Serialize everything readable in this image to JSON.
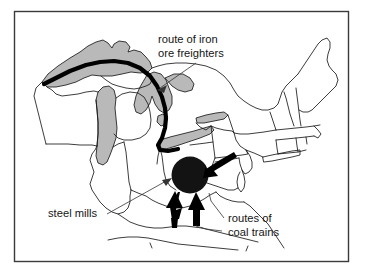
{
  "figure": {
    "type": "thematic-map",
    "region": "Northeastern and Midwestern United States",
    "background_color": "#ffffff",
    "frame_color": "#3a3a3a"
  },
  "labels": {
    "ore_route": {
      "line1": "route of iron",
      "line2": "ore freighters"
    },
    "steel_mills": {
      "line1": "steel mills"
    },
    "coal_routes": {
      "line1": "routes of",
      "line2": "coal trains"
    }
  },
  "legend_colors": {
    "lake_fill": "#b9b9b9",
    "land_fill": "#ffffff",
    "outline": "#1a1a1a",
    "route_line": "#000000",
    "steel_mill_marker": "#131313"
  },
  "map_features": {
    "lakes_shaded": true,
    "ore_route_description": "thick black line from western Lake Superior through Lake Huron to Lake Erie",
    "steel_mill_marker_description": "solid black disc over the Ohio / Pennsylvania border area",
    "coal_arrow_count": 3,
    "coal_arrow_directions": [
      "from east",
      "from south-southwest",
      "from south"
    ]
  }
}
